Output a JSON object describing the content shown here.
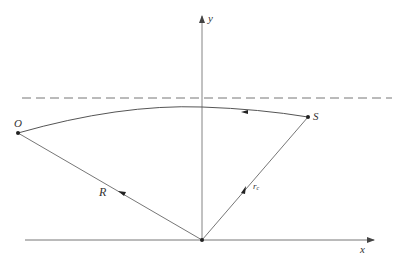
{
  "diagram": {
    "type": "geometry-ray-diagram",
    "colors": {
      "line": "#555555",
      "axis": "#666666",
      "dashed": "#777777",
      "point": "#222222",
      "text": "#333333"
    },
    "axes": {
      "x_label": "x",
      "y_label": "y"
    },
    "points": {
      "observer_label": "O",
      "source_label": "S"
    },
    "vectors": {
      "observer_vector_label": "R",
      "source_vector_label": "r",
      "source_vector_subscript": "c"
    },
    "reference_line": "dashed horizontal line above the curved path",
    "path": "curved ray from S to O, arrow pointing from S toward O"
  }
}
